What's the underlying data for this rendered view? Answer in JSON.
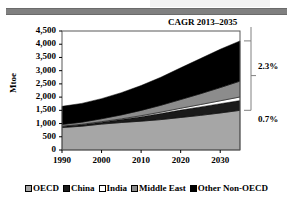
{
  "figure": {
    "annotation_title": "CAGR 2013–2035",
    "cagr_upper": "2.3%",
    "cagr_lower": "0.7%"
  },
  "legend": {
    "position": "bottom",
    "items": [
      {
        "label": "OECD",
        "color": "#a6a6a6",
        "icon": "legend-swatch-oecd"
      },
      {
        "label": "China",
        "color": "#1a1a1a",
        "icon": "legend-swatch-china"
      },
      {
        "label": "India",
        "color": "#ffffff",
        "icon": "legend-swatch-india"
      },
      {
        "label": "Middle East",
        "color": "#8c8c8c",
        "icon": "legend-swatch-middle-east"
      },
      {
        "label": "Other Non-OECD",
        "color": "#000000",
        "icon": "legend-swatch-other-non-oecd"
      }
    ]
  },
  "chart_data": {
    "type": "area",
    "title": "",
    "subtitle": "",
    "xlabel": "",
    "ylabel": "Mtoe",
    "xlim": [
      1990,
      2035
    ],
    "ylim": [
      0,
      4500
    ],
    "grid": false,
    "stacked": true,
    "legend_position": "bottom",
    "x": [
      1990,
      1995,
      2000,
      2005,
      2010,
      2015,
      2020,
      2025,
      2030,
      2035
    ],
    "xticks": [
      1990,
      2000,
      2010,
      2020,
      2030
    ],
    "xtick_labels": [
      "1990",
      "2000",
      "2010",
      "2020",
      "2030"
    ],
    "yticks": [
      0,
      500,
      1000,
      1500,
      2000,
      2500,
      3000,
      3500,
      4000,
      4500
    ],
    "ytick_labels": [
      "0",
      "500",
      "1,000",
      "1,500",
      "2,000",
      "2,500",
      "3,000",
      "3,500",
      "4,000",
      "4,500"
    ],
    "series": [
      {
        "name": "OECD",
        "color": "#a6a6a6",
        "values": [
          850,
          900,
          980,
          1040,
          1090,
          1150,
          1230,
          1310,
          1400,
          1500
        ]
      },
      {
        "name": "China",
        "color": "#1a1a1a",
        "values": [
          40,
          55,
          70,
          110,
          170,
          230,
          280,
          320,
          350,
          370
        ]
      },
      {
        "name": "India",
        "color": "#ffffff",
        "values": [
          15,
          18,
          22,
          28,
          38,
          52,
          68,
          88,
          110,
          135
        ]
      },
      {
        "name": "Middle East",
        "color": "#8c8c8c",
        "values": [
          60,
          80,
          110,
          150,
          200,
          260,
          330,
          410,
          500,
          600
        ]
      },
      {
        "name": "Other Non-OECD",
        "color": "#000000",
        "values": [
          685,
          710,
          760,
          840,
          940,
          1060,
          1200,
          1330,
          1450,
          1520
        ]
      }
    ],
    "totals": [
      1650,
      1763,
      1942,
      2168,
      2438,
      2752,
      3108,
      3458,
      3810,
      4125
    ],
    "annotations": [
      {
        "text": "CAGR 2013–2035",
        "type": "title"
      },
      {
        "text": "2.3%",
        "type": "bracket-label",
        "refers_to": "Non-OECD"
      },
      {
        "text": "0.7%",
        "type": "bracket-label",
        "refers_to": "OECD"
      }
    ]
  }
}
